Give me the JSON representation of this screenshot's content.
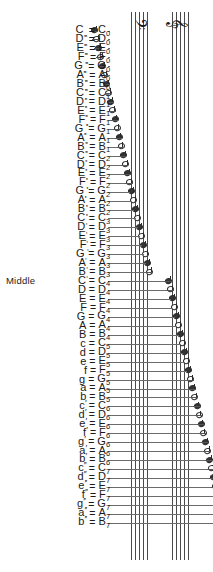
{
  "diagram": {
    "middle_label": "Middle",
    "equals": "=",
    "clefs": [
      {
        "name": "bass-clef",
        "glyph": "𝄢"
      },
      {
        "name": "treble-clef",
        "glyph": "𝄞"
      }
    ],
    "colors": {
      "ink": "#1a1a1a",
      "staff_line": "#4a4a4a",
      "leader_line": "#6b6b6b",
      "background": "#ffffff"
    },
    "rows": [
      {
        "letter": "C",
        "sub": ",,,,",
        "sup": "",
        "sci": "C",
        "oct": "0"
      },
      {
        "letter": "D",
        "sub": ",,,,",
        "sup": "",
        "sci": "D",
        "oct": "0"
      },
      {
        "letter": "E",
        "sub": ",,,,",
        "sup": "",
        "sci": "E",
        "oct": "0"
      },
      {
        "letter": "F",
        "sub": ",,,,",
        "sup": "",
        "sci": "F",
        "oct": "0"
      },
      {
        "letter": "G",
        "sub": ",,,,",
        "sup": "",
        "sci": "G",
        "oct": "0"
      },
      {
        "letter": "A",
        "sub": ",,,,",
        "sup": "",
        "sci": "A",
        "oct": "0"
      },
      {
        "letter": "B",
        "sub": ",,,,",
        "sup": "",
        "sci": "B",
        "oct": "0"
      },
      {
        "letter": "C",
        "sub": ",,,",
        "sup": "",
        "sci": "C",
        "oct": "1"
      },
      {
        "letter": "D",
        "sub": ",,,",
        "sup": "",
        "sci": "D",
        "oct": "1"
      },
      {
        "letter": "E",
        "sub": ",,,",
        "sup": "",
        "sci": "E",
        "oct": "1"
      },
      {
        "letter": "F",
        "sub": ",,,",
        "sup": "",
        "sci": "F",
        "oct": "1"
      },
      {
        "letter": "G",
        "sub": ",,,",
        "sup": "",
        "sci": "G",
        "oct": "1"
      },
      {
        "letter": "A",
        "sub": ",,,",
        "sup": "",
        "sci": "A",
        "oct": "1"
      },
      {
        "letter": "B",
        "sub": ",,,",
        "sup": "",
        "sci": "B",
        "oct": "1"
      },
      {
        "letter": "C",
        "sub": ",,",
        "sup": "",
        "sci": "C",
        "oct": "2"
      },
      {
        "letter": "D",
        "sub": ",,",
        "sup": "",
        "sci": "D",
        "oct": "2"
      },
      {
        "letter": "E",
        "sub": ",,",
        "sup": "",
        "sci": "E",
        "oct": "2"
      },
      {
        "letter": "F",
        "sub": ",,",
        "sup": "",
        "sci": "F",
        "oct": "2"
      },
      {
        "letter": "G",
        "sub": ",,",
        "sup": "",
        "sci": "G",
        "oct": "2"
      },
      {
        "letter": "A",
        "sub": ",,",
        "sup": "",
        "sci": "A",
        "oct": "2"
      },
      {
        "letter": "B",
        "sub": ",,",
        "sup": "",
        "sci": "B",
        "oct": "2"
      },
      {
        "letter": "C",
        "sub": ",",
        "sup": "",
        "sci": "C",
        "oct": "3"
      },
      {
        "letter": "D",
        "sub": ",",
        "sup": "",
        "sci": "D",
        "oct": "3"
      },
      {
        "letter": "E",
        "sub": ",",
        "sup": "",
        "sci": "E",
        "oct": "3"
      },
      {
        "letter": "F",
        "sub": ",",
        "sup": "",
        "sci": "F",
        "oct": "3"
      },
      {
        "letter": "G",
        "sub": ",",
        "sup": "",
        "sci": "G",
        "oct": "3"
      },
      {
        "letter": "A",
        "sub": ",",
        "sup": "",
        "sci": "A",
        "oct": "3"
      },
      {
        "letter": "B",
        "sub": ",",
        "sup": "",
        "sci": "B",
        "oct": "3"
      },
      {
        "letter": "C",
        "sub": "",
        "sup": "",
        "sci": "C",
        "oct": "4",
        "middle": true
      },
      {
        "letter": "D",
        "sub": "",
        "sup": "",
        "sci": "D",
        "oct": "4"
      },
      {
        "letter": "E",
        "sub": "",
        "sup": "",
        "sci": "E",
        "oct": "4"
      },
      {
        "letter": "F",
        "sub": "",
        "sup": "",
        "sci": "F",
        "oct": "4"
      },
      {
        "letter": "G",
        "sub": "",
        "sup": "",
        "sci": "G",
        "oct": "4"
      },
      {
        "letter": "A",
        "sub": "",
        "sup": "",
        "sci": "A",
        "oct": "4"
      },
      {
        "letter": "B",
        "sub": "",
        "sup": "",
        "sci": "B",
        "oct": "4"
      },
      {
        "letter": "c",
        "sub": "",
        "sup": "",
        "sci": "C",
        "oct": "5"
      },
      {
        "letter": "d",
        "sub": "",
        "sup": "",
        "sci": "D",
        "oct": "5"
      },
      {
        "letter": "e",
        "sub": "",
        "sup": "",
        "sci": "E",
        "oct": "5"
      },
      {
        "letter": "f",
        "sub": "",
        "sup": "",
        "sci": "F",
        "oct": "5"
      },
      {
        "letter": "g",
        "sub": "",
        "sup": "",
        "sci": "G",
        "oct": "5"
      },
      {
        "letter": "a",
        "sub": "",
        "sup": "",
        "sci": "A",
        "oct": "5"
      },
      {
        "letter": "b",
        "sub": "",
        "sup": "",
        "sci": "B",
        "oct": "5"
      },
      {
        "letter": "c",
        "sub": "",
        "sup": "′",
        "sci": "C",
        "oct": "6"
      },
      {
        "letter": "d",
        "sub": "",
        "sup": "′",
        "sci": "D",
        "oct": "6"
      },
      {
        "letter": "e",
        "sub": "",
        "sup": "′",
        "sci": "E",
        "oct": "6"
      },
      {
        "letter": "f",
        "sub": "",
        "sup": "′",
        "sci": "F",
        "oct": "6"
      },
      {
        "letter": "g",
        "sub": "",
        "sup": "′",
        "sci": "G",
        "oct": "6"
      },
      {
        "letter": "a",
        "sub": "",
        "sup": "′",
        "sci": "A",
        "oct": "6"
      },
      {
        "letter": "b",
        "sub": "",
        "sup": "′",
        "sci": "B",
        "oct": "6"
      },
      {
        "letter": "c",
        "sub": "",
        "sup": "′′",
        "sci": "C",
        "oct": "7"
      },
      {
        "letter": "d",
        "sub": "",
        "sup": "′′",
        "sci": "D",
        "oct": "7"
      },
      {
        "letter": "e",
        "sub": "",
        "sup": "′′",
        "sci": "E",
        "oct": "7"
      },
      {
        "letter": "f",
        "sub": "",
        "sup": "′′",
        "sci": "F",
        "oct": "7"
      },
      {
        "letter": "g",
        "sub": "",
        "sup": "′′",
        "sci": "G",
        "oct": "7"
      },
      {
        "letter": "a",
        "sub": "",
        "sup": "′′",
        "sci": "A",
        "oct": "7"
      },
      {
        "letter": "b",
        "sub": "",
        "sup": "′′",
        "sci": "B",
        "oct": "7"
      }
    ]
  }
}
